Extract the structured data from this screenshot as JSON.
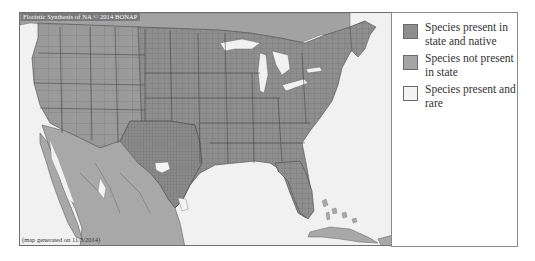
{
  "map": {
    "credit": "Floristic Synthesis of NA © 2014 BONAP",
    "generated": "(map generated on 11/3/2014)",
    "colors": {
      "native_present": "#8e8e8e",
      "not_present": "#a8a8a8",
      "present_rare": "#f4f4f4",
      "water": "#f1f1f1",
      "county_border": "#6a6a6a",
      "state_border": "#3e3e3e",
      "texas_oklahoma": "#8a8a8a"
    }
  },
  "legend": {
    "items": [
      {
        "label": "Species present in state and native",
        "swatch_color": "#8e8e8e"
      },
      {
        "label": "Species not present in state",
        "swatch_color": "#a6a6a6"
      },
      {
        "label": "Species present and rare",
        "swatch_color": "#f4f4f4"
      }
    ]
  }
}
